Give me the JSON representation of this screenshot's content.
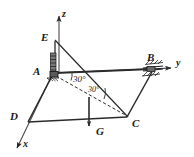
{
  "figure": {
    "background_color": "#ffffff",
    "line_color": "#2b2b2b",
    "text_color": "#1a1a1a"
  },
  "axes": [
    {
      "id": "z-axis",
      "label": "z",
      "direction": "up",
      "label_x": 62,
      "label_y": 9
    },
    {
      "id": "y-axis",
      "label": "y",
      "direction": "right",
      "label_x": 176,
      "label_y": 60
    },
    {
      "id": "x-axis",
      "label": "x",
      "direction": "down-left",
      "label_x": 23,
      "label_y": 140
    }
  ],
  "points": [
    {
      "id": "point-A",
      "label": "A",
      "label_x": 33,
      "label_y": 68,
      "x": 53,
      "y": 73
    },
    {
      "id": "point-B",
      "label": "B",
      "label_x": 147,
      "label_y": 58,
      "x": 150,
      "y": 73
    },
    {
      "id": "point-C",
      "label": "C",
      "label_x": 133,
      "label_y": 120,
      "x": 127,
      "y": 117
    },
    {
      "id": "point-D",
      "label": "D",
      "label_x": 11,
      "label_y": 112,
      "x": 28,
      "y": 122
    },
    {
      "id": "point-E",
      "label": "E",
      "label_x": 42,
      "label_y": 33,
      "x": 53,
      "y": 40
    }
  ],
  "forces": [
    {
      "id": "force-G",
      "label": "G",
      "label_x": 97,
      "label_y": 131,
      "direction": "down",
      "tail_x": 89,
      "tail_y": 97,
      "head_x": 89,
      "head_y": 130
    }
  ],
  "angles": [
    {
      "id": "angle-upper",
      "label": "30°",
      "value": 30,
      "unit": "degrees",
      "label_x": 75,
      "label_y": 78
    },
    {
      "id": "angle-lower",
      "label": "30°",
      "value": 30,
      "unit": "degrees",
      "label_x": 89,
      "label_y": 88
    }
  ],
  "supports": [
    {
      "id": "support-A",
      "type": "hatched-bearing",
      "at_point": "A",
      "orientation": "vertical"
    },
    {
      "id": "support-B",
      "type": "hatched-bearing",
      "at_point": "B",
      "orientation": "inclined"
    }
  ],
  "members": [
    {
      "id": "member-AB",
      "from": "A",
      "to": "B",
      "style": "solid"
    },
    {
      "id": "member-AD",
      "from": "A",
      "to": "D",
      "style": "solid"
    },
    {
      "id": "member-DC",
      "from": "D",
      "to": "C",
      "style": "solid"
    },
    {
      "id": "member-CB",
      "from": "C",
      "to": "B",
      "style": "solid"
    },
    {
      "id": "member-EA",
      "from": "E",
      "to": "A",
      "style": "solid"
    },
    {
      "id": "member-EC",
      "from": "E",
      "to": "C",
      "style": "solid"
    },
    {
      "id": "member-AC",
      "from": "A",
      "to": "C",
      "style": "dashed"
    }
  ]
}
